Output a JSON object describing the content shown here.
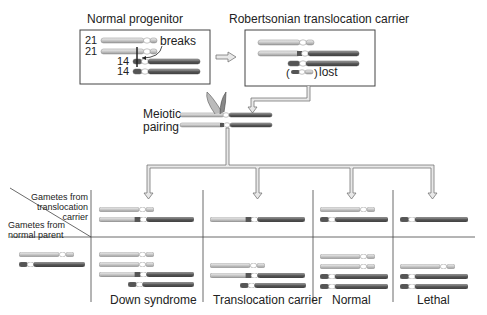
{
  "titles": {
    "normal_progenitor": "Normal progenitor",
    "carrier": "Robertsonian translocation carrier"
  },
  "labels": {
    "breaks": "breaks",
    "lost": "lost",
    "meiotic_pairing_line1": "Meiotic",
    "meiotic_pairing_line2": "pairing",
    "chr21": "21",
    "chr14": "14"
  },
  "table": {
    "header_top_line1": "Gametes from",
    "header_top_line2": "translocation",
    "header_top_line3": "carrier",
    "header_left_line1": "Gametes from",
    "header_left_line2": "normal parent",
    "outcomes": [
      "Down syndrome",
      "Translocation carrier",
      "Normal",
      "Lethal"
    ]
  },
  "colors": {
    "chr21_fill": "#d8d8d8",
    "chr14_fill": "#6a6a6a",
    "arrow_fill": "#e4e4e4",
    "line": "#444444"
  }
}
